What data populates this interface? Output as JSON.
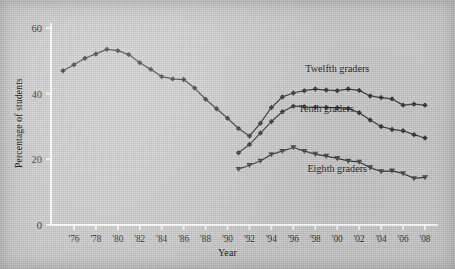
{
  "chart_data": {
    "type": "line",
    "title": "",
    "subtitle": "",
    "xlabel": "Year",
    "ylabel": "Percentage of students",
    "xlim": [
      1975,
      2008
    ],
    "ylim": [
      0,
      60
    ],
    "grid": false,
    "legend_position": "inline-annotation",
    "y_ticks": [
      0,
      20,
      40,
      60
    ],
    "y_tick_labels": [
      "0",
      "20",
      "40",
      "60"
    ],
    "x_ticks": [
      1976,
      1978,
      1980,
      1982,
      1984,
      1986,
      1988,
      1990,
      1992,
      1994,
      1996,
      1998,
      2000,
      2002,
      2004,
      2006,
      2008
    ],
    "x_tick_labels": [
      "'76",
      "'78",
      "'80",
      "'82",
      "'84",
      "'86",
      "'88",
      "'90",
      "'92",
      "'94",
      "'96",
      "'98",
      "'00",
      "'02",
      "'04",
      "'06",
      "'08"
    ],
    "series": [
      {
        "name": "Twelfth graders",
        "marker": "diamond",
        "label_x": 2000,
        "label_y": 46.5,
        "x": [
          1975,
          1976,
          1977,
          1978,
          1979,
          1980,
          1981,
          1982,
          1983,
          1984,
          1985,
          1986,
          1987,
          1988,
          1989,
          1990,
          1991,
          1992,
          1993,
          1994,
          1995,
          1996,
          1997,
          1998,
          1999,
          2000,
          2001,
          2002,
          2003,
          2004,
          2005,
          2006,
          2007,
          2008
        ],
        "values": [
          47.0,
          48.8,
          50.8,
          52.1,
          53.5,
          53.1,
          51.9,
          49.4,
          47.4,
          45.2,
          44.5,
          44.3,
          41.7,
          38.3,
          35.4,
          32.5,
          29.4,
          27.1,
          31.0,
          35.8,
          39.0,
          40.2,
          40.9,
          41.4,
          41.1,
          40.9,
          41.4,
          41.0,
          39.3,
          38.8,
          38.4,
          36.5,
          36.8,
          36.5
        ]
      },
      {
        "name": "Tenth graders",
        "marker": "diamond",
        "label_x": 1999,
        "label_y": 34.5,
        "x": [
          1991,
          1992,
          1993,
          1994,
          1995,
          1996,
          1997,
          1998,
          1999,
          2000,
          2001,
          2002,
          2003,
          2004,
          2005,
          2006,
          2007,
          2008
        ],
        "values": [
          22.0,
          24.5,
          28.0,
          31.5,
          34.5,
          36.2,
          36.0,
          35.9,
          35.8,
          35.7,
          35.5,
          34.2,
          32.0,
          30.0,
          29.1,
          28.7,
          27.5,
          26.5
        ]
      },
      {
        "name": "Eighth graders",
        "marker": "triangle",
        "label_x": 2000,
        "label_y": 16.0,
        "x": [
          1991,
          1992,
          1993,
          1994,
          1995,
          1996,
          1997,
          1998,
          1999,
          2000,
          2001,
          2002,
          2003,
          2004,
          2005,
          2006,
          2007,
          2008
        ],
        "values": [
          17.0,
          18.2,
          19.5,
          21.5,
          22.5,
          23.6,
          22.5,
          21.6,
          21.0,
          20.3,
          19.5,
          19.2,
          17.5,
          16.3,
          16.5,
          15.7,
          14.2,
          14.5
        ]
      }
    ]
  }
}
